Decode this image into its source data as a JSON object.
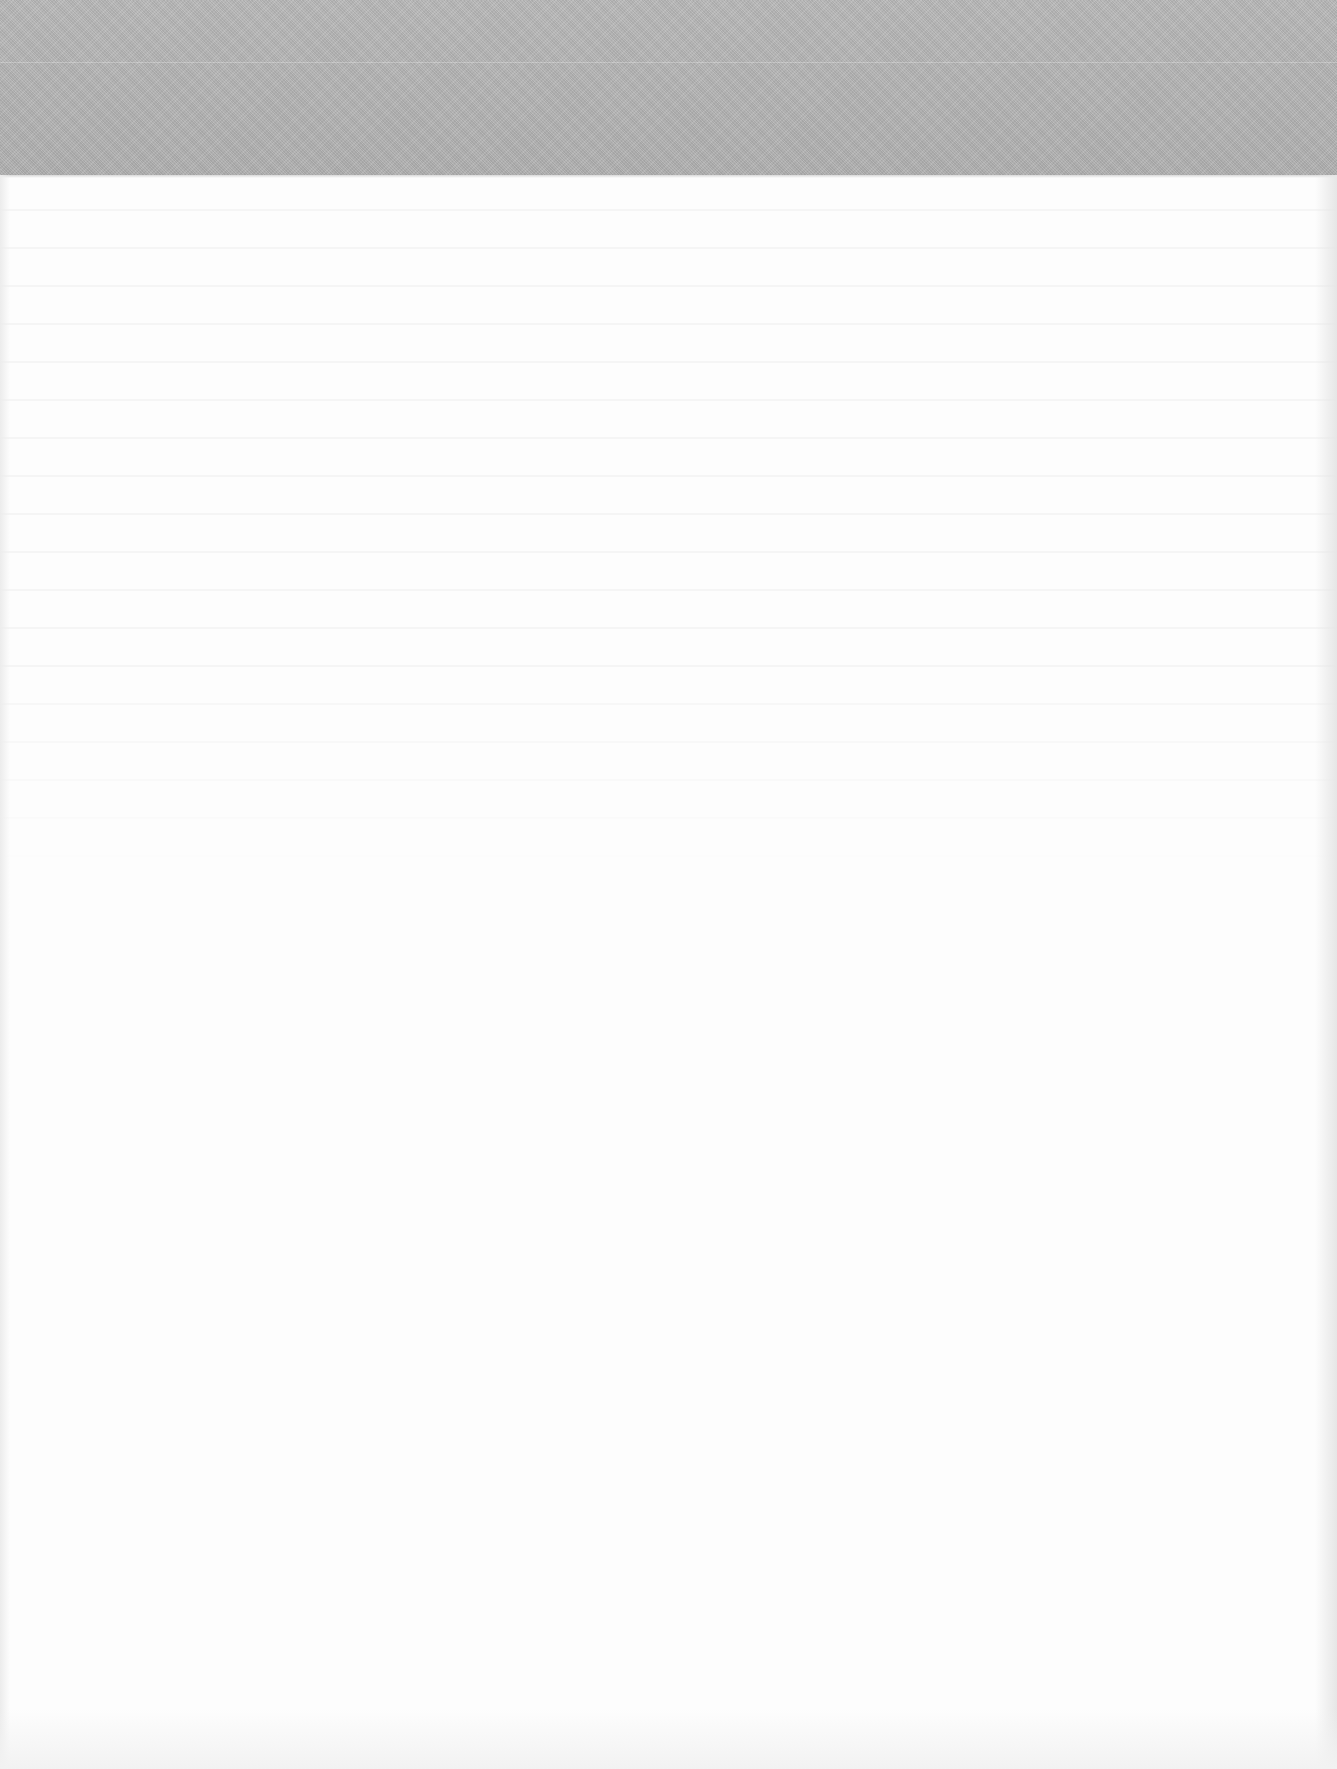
{
  "page": {
    "type": "scanned-blank-page",
    "background_color": "#fdfdfd",
    "top_band": {
      "color": "#b4b4b4",
      "height_px": 175
    },
    "legible_text": []
  }
}
